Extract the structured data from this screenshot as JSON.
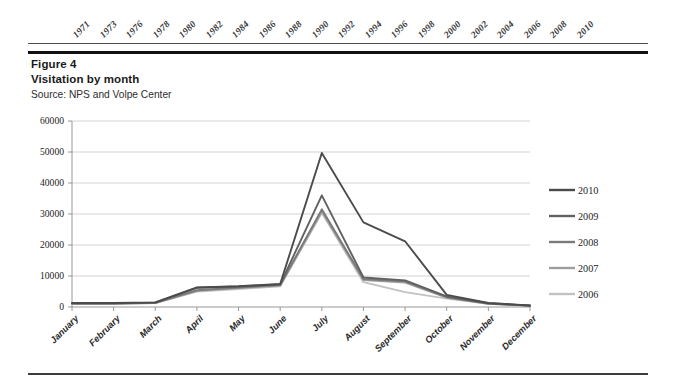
{
  "top_ruler": {
    "name": "year-axis-strip",
    "years": [
      "1971",
      "1973",
      "1976",
      "1978",
      "1980",
      "1982",
      "1984",
      "1986",
      "1988",
      "1990",
      "1992",
      "1994",
      "1996",
      "1998",
      "2000",
      "2002",
      "2004",
      "2006",
      "2008",
      "2010"
    ]
  },
  "caption": {
    "figure_number": "Figure 4",
    "figure_title": "Visitation by month",
    "source": "Source: NPS and Volpe Center"
  },
  "chart_data": {
    "type": "line",
    "title": "Visitation by month",
    "subtitle": "Source: NPS and Volpe Center",
    "xlabel": "",
    "ylabel": "",
    "ylim": [
      0,
      60000
    ],
    "ytick_step": 10000,
    "yticks": [
      "0",
      "10000",
      "20000",
      "30000",
      "40000",
      "50000",
      "60000"
    ],
    "grid": true,
    "legend_position": "right",
    "categories": [
      "January",
      "February",
      "March",
      "April",
      "May",
      "June",
      "July",
      "August",
      "September",
      "October",
      "November",
      "December"
    ],
    "series": [
      {
        "name": "2010",
        "color": "#4b4b4b",
        "values": [
          1300,
          1300,
          1500,
          6300,
          6700,
          7400,
          49700,
          27300,
          21200,
          3900,
          1300,
          500
        ]
      },
      {
        "name": "2009",
        "color": "#616161",
        "values": [
          1200,
          1200,
          1400,
          6200,
          6600,
          7300,
          36000,
          9500,
          8600,
          3400,
          1200,
          450
        ]
      },
      {
        "name": "2008",
        "color": "#7a7a7a",
        "values": [
          1100,
          1150,
          1350,
          5400,
          6300,
          7100,
          31500,
          9000,
          8300,
          3200,
          1100,
          430
        ]
      },
      {
        "name": "2007",
        "color": "#9e9e9e",
        "values": [
          1050,
          1100,
          1300,
          5200,
          6100,
          6900,
          30800,
          8700,
          7900,
          3000,
          1050,
          410
        ]
      },
      {
        "name": "2006",
        "color": "#c2c2c2",
        "values": [
          1000,
          1050,
          1250,
          5000,
          5800,
          6700,
          30400,
          8000,
          4800,
          2700,
          1000,
          380
        ]
      }
    ]
  }
}
